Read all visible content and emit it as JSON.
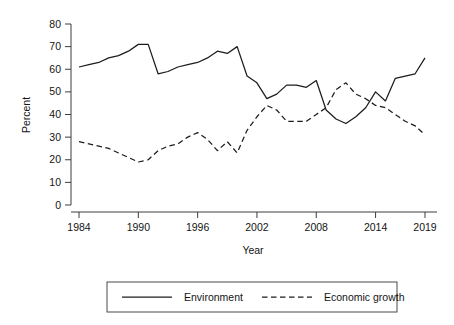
{
  "chart_data": {
    "type": "line",
    "title": "",
    "subtitle": "",
    "xlabel": "Year",
    "ylabel": "Percent",
    "xlim": [
      1984,
      2019
    ],
    "ylim": [
      0,
      80
    ],
    "xticks": [
      1984,
      1990,
      1996,
      2002,
      2008,
      2014,
      2019
    ],
    "xtick_labels": [
      "1984",
      "1990",
      "1996",
      "2002",
      "2008",
      "2014",
      "2019"
    ],
    "yticks": [
      0,
      10,
      20,
      30,
      40,
      50,
      60,
      70,
      80
    ],
    "ytick_labels": [
      "0",
      "10",
      "20",
      "30",
      "40",
      "50",
      "60",
      "70",
      "80"
    ],
    "grid": false,
    "legend_position": "below",
    "x": [
      1984,
      1985,
      1986,
      1987,
      1988,
      1989,
      1990,
      1991,
      1992,
      1993,
      1994,
      1995,
      1996,
      1997,
      1998,
      1999,
      2000,
      2001,
      2002,
      2003,
      2004,
      2005,
      2006,
      2007,
      2008,
      2009,
      2010,
      2011,
      2012,
      2013,
      2014,
      2015,
      2016,
      2017,
      2018,
      2019
    ],
    "series": [
      {
        "name": "Environment",
        "style": "solid",
        "color": "#1c1c1c",
        "values": [
          61,
          62,
          63,
          65,
          66,
          68,
          71,
          71,
          58,
          59,
          61,
          62,
          63,
          65,
          68,
          67,
          70,
          57,
          54,
          47,
          49,
          53,
          53,
          52,
          55,
          42,
          38,
          36,
          39,
          43,
          50,
          46,
          56,
          57,
          58,
          65
        ]
      },
      {
        "name": "Economic growth",
        "style": "dashed",
        "color": "#1c1c1c",
        "values": [
          28,
          27,
          26,
          25,
          23,
          21,
          19,
          20,
          24,
          26,
          27,
          30,
          32,
          29,
          24,
          28,
          23,
          33,
          39,
          44,
          42,
          37,
          37,
          37,
          40,
          43,
          51,
          54,
          49,
          47,
          44,
          43,
          40,
          37,
          35,
          31
        ]
      }
    ],
    "legend": [
      {
        "label": "Environment",
        "style": "solid"
      },
      {
        "label": "Economic growth",
        "style": "dashed"
      }
    ]
  }
}
